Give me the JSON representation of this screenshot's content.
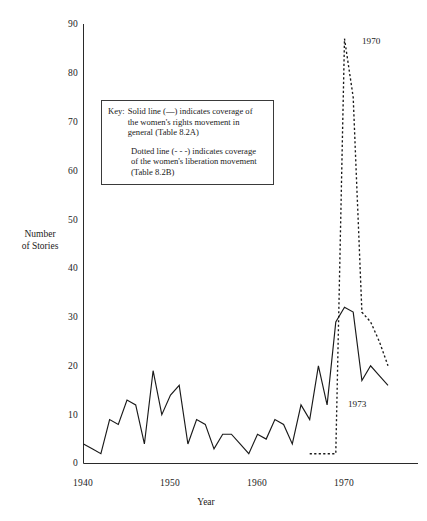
{
  "chart_data": {
    "type": "line",
    "title": "",
    "xlabel": "Year",
    "ylabel": "Number of Stories",
    "xlim": [
      1940,
      1976
    ],
    "ylim": [
      0,
      90
    ],
    "xticks": [
      1940,
      1950,
      1960,
      1970
    ],
    "yticks": [
      0,
      10,
      20,
      30,
      40,
      50,
      60,
      70,
      80,
      90
    ],
    "grid": false,
    "legend_position": "inside-upper-left",
    "annotations": [
      {
        "label": "1970",
        "x": 1970,
        "y": 87,
        "note": "peak of dotted line"
      },
      {
        "label": "1973",
        "x": 1973,
        "y": 12,
        "note": "near end of solid line"
      }
    ],
    "series": [
      {
        "name": "Solid line (—) indicates coverage of the women's rights movement in general (Table 8.2A)",
        "style": "solid",
        "x": [
          1940,
          1941,
          1942,
          1943,
          1944,
          1945,
          1946,
          1947,
          1948,
          1949,
          1950,
          1951,
          1952,
          1953,
          1954,
          1955,
          1956,
          1957,
          1958,
          1959,
          1960,
          1961,
          1962,
          1963,
          1964,
          1965,
          1966,
          1967,
          1968,
          1969,
          1970,
          1971,
          1972,
          1973,
          1974,
          1975
        ],
        "values": [
          4,
          3,
          2,
          9,
          8,
          13,
          12,
          4,
          19,
          10,
          14,
          16,
          4,
          9,
          8,
          3,
          6,
          6,
          4,
          2,
          6,
          5,
          9,
          8,
          4,
          12,
          9,
          20,
          12,
          29,
          32,
          31,
          17,
          20,
          18,
          16
        ]
      },
      {
        "name": "Dotted line (- - -) indicates coverage of the women's liberation movement (Table 8.2B)",
        "style": "dotted",
        "x": [
          1966,
          1967,
          1968,
          1969,
          1970,
          1971,
          1972,
          1973,
          1974,
          1975
        ],
        "values": [
          2,
          2,
          2,
          2,
          87,
          75,
          31,
          29,
          25,
          20
        ]
      }
    ]
  },
  "key": {
    "label": "Key:",
    "line1": "Solid line (—) indicates coverage of",
    "line2": "the women's rights movement in",
    "line3": "general (Table 8.2A)",
    "line4": "Dotted line (- - -) indicates coverage",
    "line5": "of the women's liberation movement",
    "line6": "(Table 8.2B)"
  },
  "axes": {
    "ylabel_line1": "Number",
    "ylabel_line2": "of Stories",
    "xlabel": "Year",
    "yticks": [
      "90",
      "80",
      "70",
      "60",
      "50",
      "40",
      "30",
      "20",
      "10",
      "0"
    ],
    "xticks": [
      "1940",
      "1950",
      "1960",
      "1970"
    ]
  },
  "annotations": {
    "peak_year": "1970",
    "late_year": "1973"
  },
  "colors": {
    "line": "#1a1a1a",
    "axis": "#2a2a2a",
    "background": "#ffffff"
  }
}
